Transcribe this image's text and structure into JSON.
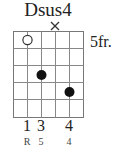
{
  "chord": {
    "name": "Dsus4",
    "start_fret_label": "5fr.",
    "strings": 6,
    "frets_shown": 5,
    "muted_strings": [
      4
    ],
    "open_strings": [],
    "markers": [
      {
        "string": 2,
        "fret": 1,
        "type": "open-circle"
      },
      {
        "string": 3,
        "fret": 3,
        "type": "dot"
      },
      {
        "string": 5,
        "fret": 4,
        "type": "dot"
      }
    ],
    "fingers": [
      {
        "string": 1,
        "label": "1"
      },
      {
        "string": 3,
        "label": "3"
      },
      {
        "string": 5,
        "label": "4"
      }
    ],
    "intervals": [
      {
        "string": 1,
        "label": "R"
      },
      {
        "string": 3,
        "label": "5"
      },
      {
        "string": 5,
        "label": "4"
      }
    ]
  }
}
